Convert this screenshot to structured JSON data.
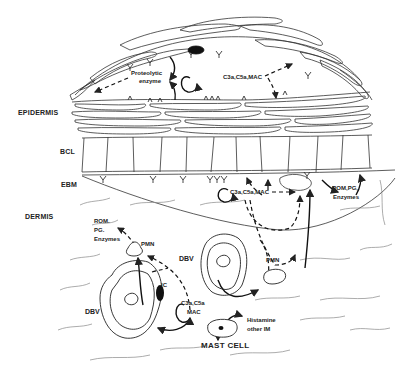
{
  "figure": {
    "type": "schematic diagram"
  },
  "layers": {
    "epidermis": "EPIDERMIS",
    "bcl": "BCL",
    "ebm": "EBM",
    "dermis": "DERMIS"
  },
  "labels": {
    "proteolytic": "Proteolytic",
    "enzyme": "enzyme",
    "c3a_top": "C3a,C5a,MAC",
    "c3a_ebm": "C3a,C5a,MAC",
    "rom_pg_right": "ROM,PG,",
    "enzymes_right": "Enzymes",
    "rom_left": "ROM.",
    "pg_left": "PG.",
    "enzymes_left": "Enzymes",
    "pmn_left": "PMN",
    "pmn_right": "PMN",
    "dbv_upper": "DBV",
    "dbv_lower": "DBV",
    "ic": "IC",
    "c3a_c5a_lower": "C3a,C5a",
    "mac_lower": "MAC",
    "histamine": "Histamine",
    "other_im": "other IM",
    "mast_cell": "MAST CELL"
  },
  "colors": {
    "ink": "#222222",
    "background": "#ffffff"
  }
}
